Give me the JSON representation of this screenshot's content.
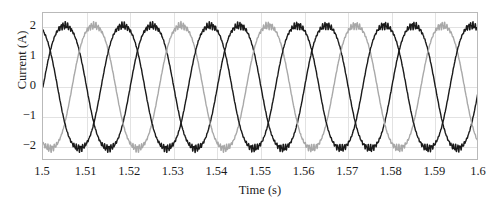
{
  "chart_data": {
    "type": "line",
    "title": "",
    "xlabel": "Time (s)",
    "ylabel": "Current (A)",
    "xlim": [
      1.5,
      1.6
    ],
    "ylim": [
      -2.45,
      2.45
    ],
    "xticks": [
      1.5,
      1.51,
      1.52,
      1.53,
      1.54,
      1.55,
      1.56,
      1.57,
      1.58,
      1.59,
      1.6
    ],
    "xticklabels": [
      "1.5",
      "1.51",
      "1.52",
      "1.53",
      "1.54",
      "1.55",
      "1.56",
      "1.57",
      "1.58",
      "1.59",
      "1.6"
    ],
    "yticks": [
      2,
      1,
      0,
      -1,
      -2
    ],
    "yticklabels": [
      "2",
      "1",
      "0",
      "−1",
      "−2"
    ],
    "grid": true,
    "grid_color": "#e2e2e2",
    "legend": null,
    "frequency_hz": 50,
    "amplitude_a": 2.15,
    "ripple_amplitude_a": 0.06,
    "ripple_frequency_hz": 2000,
    "series": [
      {
        "name": "Phase A",
        "color": "#1a1a1a",
        "linewidth": 1.4,
        "phase_deg": 0,
        "amplitude": 2.15
      },
      {
        "name": "Phase B",
        "color": "#a8a8a8",
        "linewidth": 1.4,
        "phase_deg": -120,
        "amplitude": 2.15
      },
      {
        "name": "Phase C",
        "color": "#1a1a1a",
        "linewidth": 1.4,
        "phase_deg": 120,
        "amplitude": 2.15
      }
    ]
  },
  "axes": {
    "box_color": "#b9b9b9"
  }
}
